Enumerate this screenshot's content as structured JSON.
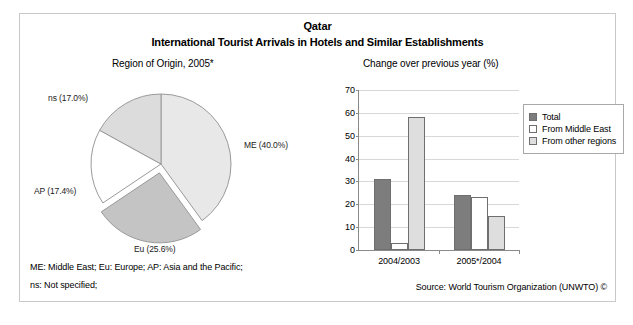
{
  "header": {
    "country": "Qatar",
    "title": "International Tourist Arrivals in Hotels and Similar Establishments",
    "left_subtitle": "Region of Origin, 2005*",
    "right_subtitle": "Change over previous year (%)"
  },
  "footer": {
    "abbreviations_line1": "ME: Middle East; Eu: Europe; AP: Asia and the Pacific;",
    "abbreviations_line2": "ns: Not specified;",
    "source": "Source: World Tourism Organization (UNWTO) ©"
  },
  "legend": {
    "items": [
      {
        "label": "Total",
        "color": "#7d7d7d"
      },
      {
        "label": "From Middle East",
        "color": "#ffffff"
      },
      {
        "label": "From other regions",
        "color": "#dedede"
      }
    ]
  },
  "chart_data": [
    {
      "type": "pie",
      "title": "Region of Origin, 2005*",
      "labels": [
        "ME (40.0%)",
        "Eu (25.6%)",
        "AP (17.4%)",
        "ns (17.0%)"
      ],
      "categories": [
        "ME",
        "Eu",
        "AP",
        "ns"
      ],
      "values": [
        40.0,
        25.6,
        17.4,
        17.0
      ],
      "colors": [
        "#e8e8e8",
        "#c4c4c4",
        "#ffffff",
        "#dcdcdc"
      ],
      "exploded": [
        false,
        true,
        false,
        false
      ],
      "legend": "labels-outside"
    },
    {
      "type": "bar",
      "title": "Change over previous year (%)",
      "categories": [
        "2004/2003",
        "2005*/2004"
      ],
      "series": [
        {
          "name": "Total",
          "values": [
            31,
            24
          ],
          "color": "#7d7d7d"
        },
        {
          "name": "From Middle East",
          "values": [
            3,
            23
          ],
          "color": "#ffffff"
        },
        {
          "name": "From other regions",
          "values": [
            58,
            15
          ],
          "color": "#dedede"
        }
      ],
      "xlabel": "",
      "ylabel": "",
      "ylim": [
        0,
        70
      ],
      "yticks": [
        0,
        10,
        20,
        30,
        40,
        50,
        60,
        70
      ],
      "grid": true,
      "legend_position": "upper right"
    }
  ]
}
